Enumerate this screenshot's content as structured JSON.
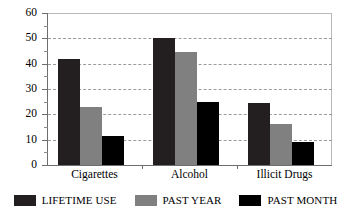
{
  "chart_data": {
    "type": "bar",
    "title": "",
    "xlabel": "",
    "ylabel": "",
    "categories": [
      "Cigarettes",
      "Alcohol",
      "Illicit Drugs"
    ],
    "series": [
      {
        "name": "LIFETIME USE",
        "color": "#231f20",
        "values": [
          42,
          50,
          24.5
        ]
      },
      {
        "name": "PAST YEAR",
        "color": "#808080",
        "values": [
          23,
          44.5,
          16
        ]
      },
      {
        "name": "PAST MONTH",
        "color": "#000000",
        "values": [
          11.5,
          25,
          9
        ]
      }
    ],
    "ylim": [
      0,
      60
    ],
    "yticks": [
      0,
      10,
      20,
      30,
      40,
      50,
      60
    ],
    "ytick_labels": [
      "0",
      "10",
      "20",
      "30",
      "40",
      "50",
      "60"
    ],
    "minor_tick_step": 5,
    "grid": true,
    "grid_style": "dashed",
    "grid_color": "#9b9b9b",
    "legend_position": "bottom"
  },
  "axis": {
    "line_color": "#6e6e6e",
    "frame_color": "#b9b9b9"
  }
}
